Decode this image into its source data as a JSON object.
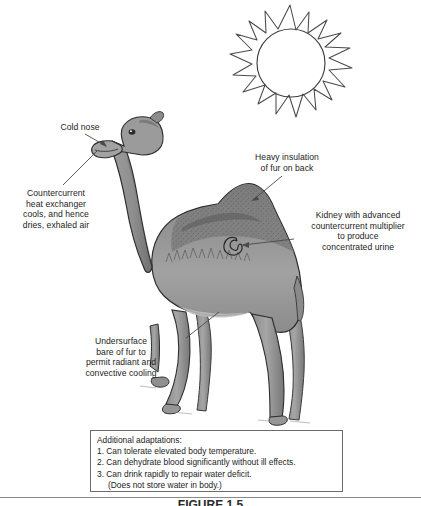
{
  "figure": {
    "type": "biology-textbook-illustration",
    "caption": "FIGURE 1.5",
    "background_color": "#ffffff",
    "ink_color": "#1c1c1c",
    "body_fill_color": "#9a9a9a",
    "body_shadow_color": "#6e6e6e",
    "outline_color": "#2b2b2b"
  },
  "sun": {
    "name": "sun",
    "outline_color": "#4a4a4a",
    "fill": "none"
  },
  "labels": {
    "cold_nose": "Cold nose",
    "countercurrent": "Countercurrent\nheat exchanger\ncools, and hence\ndries, exhaled air",
    "heavy_insulation": "Heavy insulation\nof fur on back",
    "kidney": "Kidney with advanced\ncountercurrent multiplier\nto produce\nconcentrated urine",
    "undersurface": "Undersurface\nbare of fur to\npermit radiant and\nconvective cooling"
  },
  "adaptations_box": {
    "heading": "Additional adaptations:",
    "items": [
      "1. Can tolerate elevated body temperature.",
      "2. Can dehydrate blood significantly without ill effects.",
      "3. Can drink rapidly to repair water deficit."
    ],
    "sub_item": "(Does not store water in body.)",
    "border_color": "#6b6b6b"
  }
}
